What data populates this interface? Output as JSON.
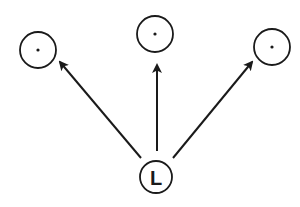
{
  "diagram": {
    "type": "fan-out",
    "colors": {
      "stroke": "#1a1a1a",
      "background": "#ffffff"
    },
    "root": {
      "label": "L",
      "cx": 156,
      "cy": 177,
      "r": 16
    },
    "targets": [
      {
        "name": "left",
        "cx": 38,
        "cy": 50,
        "r": 18,
        "marker": "dot"
      },
      {
        "name": "middle",
        "cx": 155,
        "cy": 34,
        "r": 18,
        "marker": "dot"
      },
      {
        "name": "right",
        "cx": 272,
        "cy": 47,
        "r": 18,
        "marker": "dot"
      }
    ],
    "edges": [
      {
        "from": "L",
        "to": "left",
        "x1": 141,
        "y1": 158,
        "x2": 60,
        "y2": 62
      },
      {
        "from": "L",
        "to": "middle",
        "x1": 157,
        "y1": 151,
        "x2": 157,
        "y2": 65
      },
      {
        "from": "L",
        "to": "right",
        "x1": 173,
        "y1": 158,
        "x2": 252,
        "y2": 62
      }
    ]
  }
}
